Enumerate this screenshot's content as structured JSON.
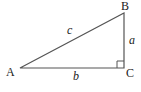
{
  "diagram": {
    "type": "right-triangle",
    "vertices": [
      {
        "id": "A",
        "label": "A"
      },
      {
        "id": "B",
        "label": "B"
      },
      {
        "id": "C",
        "label": "C"
      }
    ],
    "sides": [
      {
        "id": "c",
        "label": "c",
        "between": [
          "A",
          "B"
        ]
      },
      {
        "id": "a",
        "label": "a",
        "between": [
          "B",
          "C"
        ]
      },
      {
        "id": "b",
        "label": "b",
        "between": [
          "A",
          "C"
        ]
      }
    ],
    "right_angle_at": "C",
    "colors": {
      "stroke": "#555555",
      "text": "#222222",
      "background": "#ffffff"
    }
  }
}
